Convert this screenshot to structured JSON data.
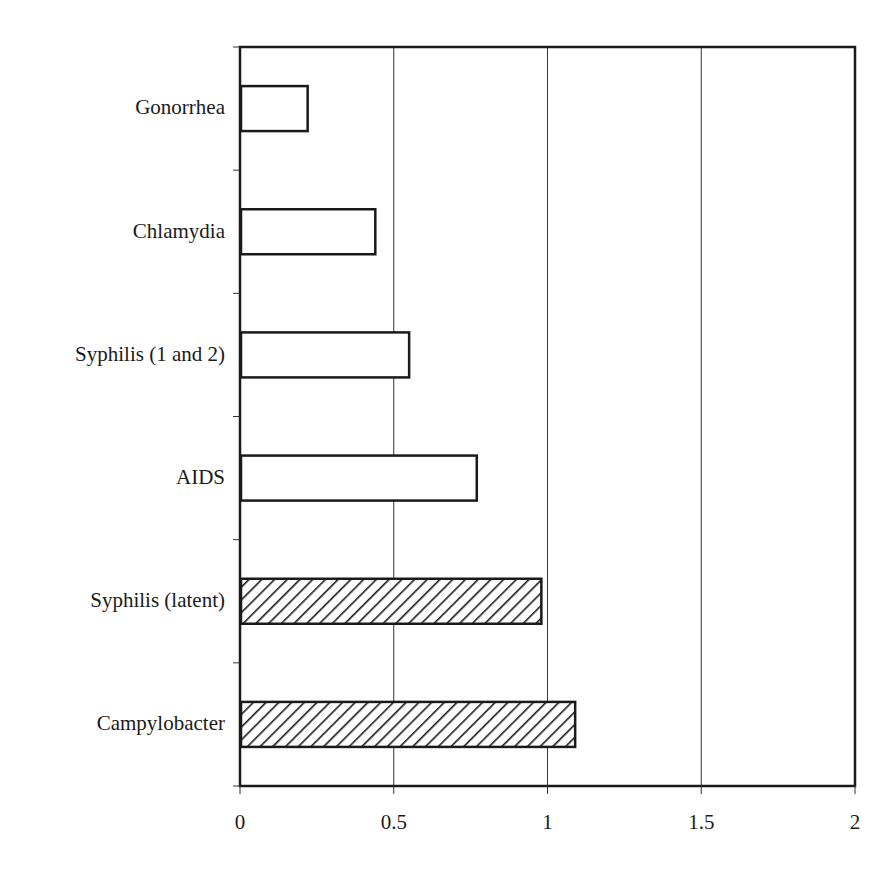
{
  "chart_data": {
    "type": "bar",
    "orientation": "horizontal",
    "title": "",
    "xlabel": "",
    "ylabel": "",
    "categories": [
      "Gonorrhea",
      "Chlamydia",
      "Syphilis (1 and 2)",
      "AIDS",
      "Syphilis (latent)",
      "Campylobacter"
    ],
    "values": [
      0.22,
      0.44,
      0.55,
      0.77,
      0.98,
      1.09
    ],
    "fill_pattern": [
      "none",
      "none",
      "none",
      "none",
      "hatched",
      "hatched"
    ],
    "xlim": [
      0,
      2
    ],
    "xticks": [
      "0",
      "0.5",
      "1",
      "1.5",
      "2"
    ],
    "grid": "vertical lines at 0.5, 1, 1.5",
    "legend": null
  },
  "plot": {
    "left": 240,
    "right": 855,
    "top": 47,
    "bottom": 786
  }
}
